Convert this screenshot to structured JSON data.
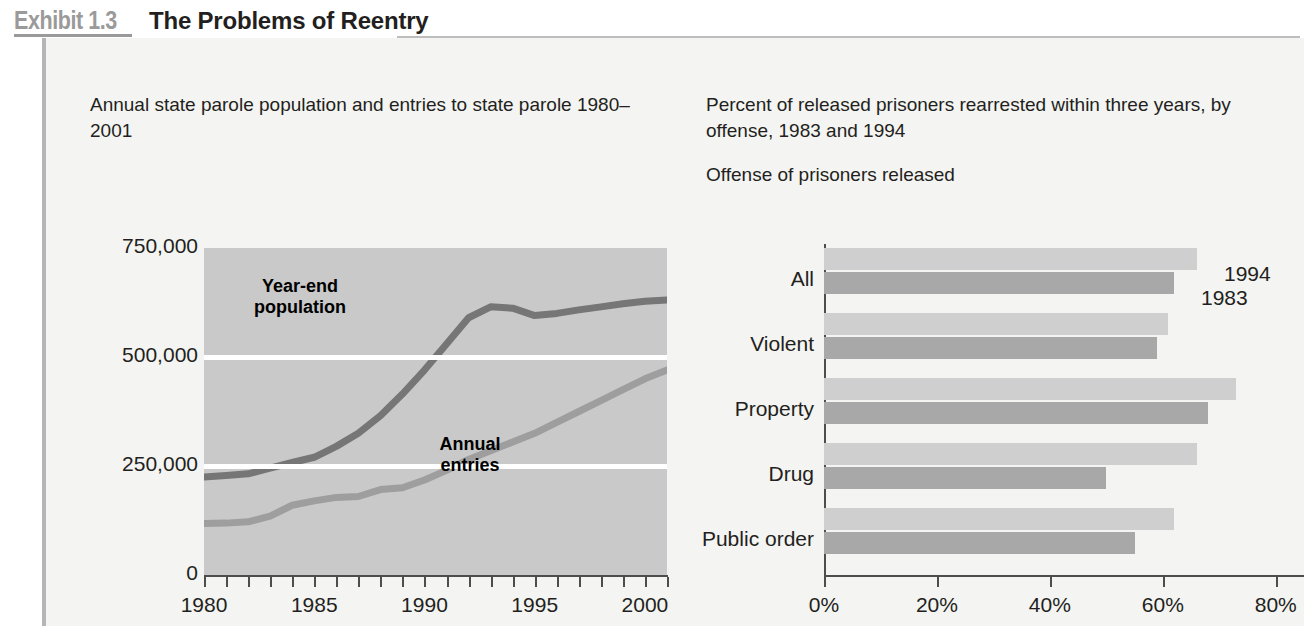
{
  "exhibit": {
    "number": "Exhibit 1.3",
    "title": "The Problems of Reentry"
  },
  "left": {
    "caption": "Annual state parole population and entries to state parole 1980–2001"
  },
  "right": {
    "caption": "Percent of released prisoners rearrested within three years, by offense, 1983 and 1994",
    "subtitle": "Offense of prisoners released"
  },
  "chart_data": [
    {
      "type": "line",
      "title": "Annual state parole population and entries to state parole 1980–2001",
      "xlabel": "",
      "ylabel": "",
      "xlim": [
        1980,
        2001
      ],
      "ylim": [
        0,
        750000
      ],
      "grid": true,
      "x": [
        1980,
        1981,
        1982,
        1983,
        1984,
        1985,
        1986,
        1987,
        1988,
        1989,
        1990,
        1991,
        1992,
        1993,
        1994,
        1995,
        1996,
        1997,
        1998,
        1999,
        2000,
        2001
      ],
      "y_ticks": [
        0,
        250000,
        500000,
        750000
      ],
      "y_tick_labels": [
        "0",
        "250,000",
        "500,000",
        "750,000"
      ],
      "x_tick_labels": [
        "1980",
        "1985",
        "1990",
        "1995",
        "2000"
      ],
      "series": [
        {
          "name": "Year-end population",
          "color": "#767676",
          "values": [
            225000,
            228000,
            232000,
            245000,
            258000,
            270000,
            295000,
            325000,
            365000,
            415000,
            470000,
            530000,
            590000,
            615000,
            612000,
            595000,
            600000,
            608000,
            615000,
            622000,
            628000,
            631000
          ]
        },
        {
          "name": "Annual entries",
          "color": "#9e9e9e",
          "values": [
            118000,
            119000,
            122000,
            135000,
            160000,
            170000,
            178000,
            180000,
            196000,
            200000,
            218000,
            240000,
            265000,
            285000,
            305000,
            325000,
            350000,
            375000,
            400000,
            425000,
            450000,
            470000
          ]
        }
      ],
      "annotations": [
        {
          "text": "Year-end population",
          "series": "Year-end population"
        },
        {
          "text": "Annual entries",
          "series": "Annual entries"
        }
      ]
    },
    {
      "type": "bar",
      "orientation": "horizontal",
      "title": "Percent of released prisoners rearrested within three years, by offense, 1983 and 1994",
      "xlabel": "",
      "ylabel": "Offense of prisoners released",
      "xlim": [
        0,
        85
      ],
      "x_tick_labels": [
        "0%",
        "20%",
        "40%",
        "60%",
        "80%"
      ],
      "x_ticks": [
        0,
        20,
        40,
        60,
        80
      ],
      "categories": [
        "All",
        "Violent",
        "Property",
        "Drug",
        "Public order"
      ],
      "series": [
        {
          "name": "1994",
          "color": "#cfcfcf",
          "values": [
            66,
            61,
            73,
            66,
            62
          ]
        },
        {
          "name": "1983",
          "color": "#a8a8a8",
          "values": [
            62,
            59,
            68,
            50,
            55
          ]
        }
      ],
      "legend_position": "inline-right"
    }
  ]
}
